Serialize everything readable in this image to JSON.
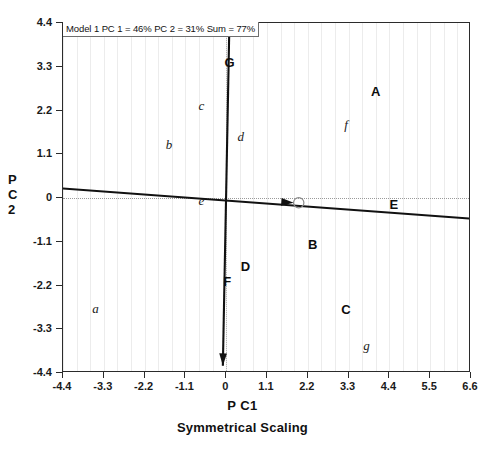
{
  "chart_data": {
    "type": "scatter",
    "title": "Model 1 PC 1 = 46% PC 2 = 31% Sum = 77%",
    "xlabel": "P C1",
    "ylabel": "P C 2",
    "subtitle": "Symmetrical Scaling",
    "xlim": [
      -4.4,
      6.6
    ],
    "ylim": [
      -4.4,
      4.4
    ],
    "xticks": [
      "-4.4",
      "-3.3",
      "-2.2",
      "-1.1",
      "0",
      "1.1",
      "2.2",
      "3.3",
      "4.4",
      "5.5",
      "6.6"
    ],
    "xtick_values": [
      -4.4,
      -3.3,
      -2.2,
      -1.1,
      0,
      1.1,
      2.2,
      3.3,
      4.4,
      5.5,
      6.6
    ],
    "yticks": [
      "4.4",
      "3.3",
      "2.2",
      "1.1",
      "0",
      "-1.1",
      "-2.2",
      "-3.3",
      "-4.4"
    ],
    "ytick_values": [
      4.4,
      3.3,
      2.2,
      1.1,
      0,
      -1.1,
      -2.2,
      -3.3,
      -4.4
    ],
    "grid": "faint-vertical",
    "legend": "none",
    "sites": [
      {
        "label": "A",
        "x": 4.03,
        "y": 2.69
      },
      {
        "label": "B",
        "x": 2.33,
        "y": -1.16
      },
      {
        "label": "C",
        "x": 3.23,
        "y": -2.78
      },
      {
        "label": "D",
        "x": 0.52,
        "y": -1.72
      },
      {
        "label": "E",
        "x": 4.52,
        "y": -0.14
      },
      {
        "label": "F",
        "x": 0.03,
        "y": -2.08
      },
      {
        "label": "G",
        "x": 0.09,
        "y": 3.42
      }
    ],
    "species": [
      {
        "label": "a",
        "x": -3.52,
        "y": -2.78
      },
      {
        "label": "b",
        "x": -1.54,
        "y": 1.33
      },
      {
        "label": "c",
        "x": -0.67,
        "y": 2.31
      },
      {
        "label": "d",
        "x": 0.39,
        "y": 1.53
      },
      {
        "label": "e",
        "x": -0.67,
        "y": -0.08
      },
      {
        "label": "f",
        "x": 3.23,
        "y": 1.83
      },
      {
        "label": "g",
        "x": 3.78,
        "y": -3.72
      }
    ],
    "vectors": [
      {
        "name": "vertical-axis-vector",
        "x1": 0.09,
        "y1": 4.58,
        "x2": -0.09,
        "y2": -4.22,
        "arrows": "both"
      },
      {
        "name": "horizontal-axis-vector",
        "x1": -4.55,
        "y1": 0.25,
        "x2": 6.75,
        "y2": -0.53,
        "arrows": "mid-right",
        "marker_x": 1.82,
        "marker_y": -0.12
      }
    ],
    "colors": {
      "axis": "#2b2b2b",
      "grid": "#ececec",
      "reference": "#9a9a9a",
      "text": "#111111",
      "vector": "#111111"
    }
  }
}
